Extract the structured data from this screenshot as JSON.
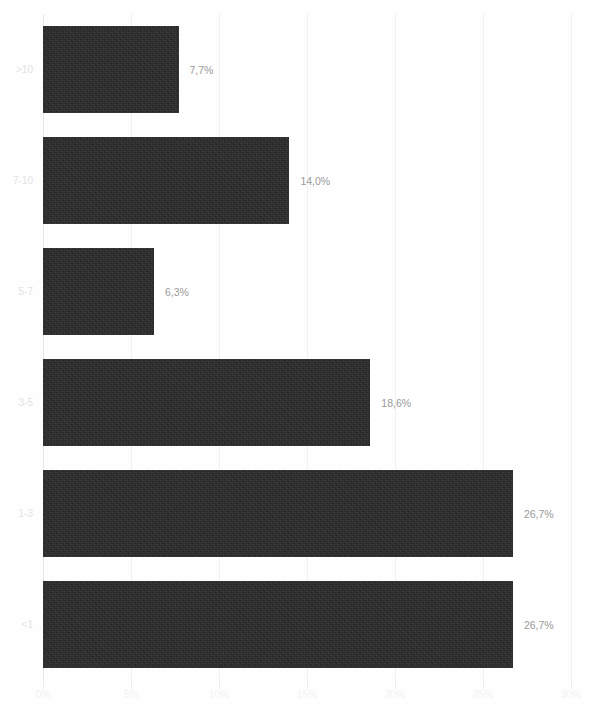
{
  "chart_data": {
    "type": "bar",
    "orientation": "horizontal",
    "title": "",
    "subtitle": "",
    "xlabel": "",
    "ylabel": "",
    "xlim": [
      0,
      30
    ],
    "grid": true,
    "legend": null,
    "categories": [
      ">10",
      "7-10",
      "5-7",
      "3-5",
      "1-3",
      "<1"
    ],
    "values": [
      7.7,
      14.0,
      6.3,
      18.6,
      26.7,
      26.7
    ],
    "data_labels": [
      "7,7%",
      "14,0%",
      "6,3%",
      "18,6%",
      "26,7%",
      "26,7%"
    ],
    "xticks": [
      0,
      5,
      10,
      15,
      20,
      25,
      30
    ],
    "xtick_labels": [
      "0%",
      "5%",
      "10%",
      "15%",
      "20%",
      "25%",
      "30%"
    ],
    "bars": [
      {
        "category": ">10",
        "value": 7.7,
        "label": "7,7%"
      },
      {
        "category": "7-10",
        "value": 14.0,
        "label": "14,0%"
      },
      {
        "category": "5-7",
        "value": 6.3,
        "label": "6,3%"
      },
      {
        "category": "3-5",
        "value": 18.6,
        "label": "18,6%"
      },
      {
        "category": "1-3",
        "value": 26.7,
        "label": "26,7%"
      },
      {
        "category": "<1",
        "value": 26.7,
        "label": "26,7%"
      }
    ]
  },
  "colors": {
    "bar_fill": "#2b2b2b",
    "gridline": "#f1f1f1",
    "axis_line": "#e6e6e6",
    "value_label": "#9a9a9a",
    "category_label": "#e3e3e3",
    "tick_label": "#f2f2f2",
    "background": "#fefefe"
  }
}
